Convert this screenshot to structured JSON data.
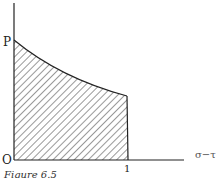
{
  "figure": {
    "caption": "Figure 6.5",
    "labels": {
      "y_intercept": "P",
      "origin": "O",
      "x_tick": "1",
      "x_axis": "σ−τ"
    },
    "colors": {
      "ink": "#333333",
      "background": "#ffffff"
    }
  },
  "diagram": {
    "type": "shaded region under decreasing curve",
    "region": "hatched area bounded by y-axis, x-axis, vertical line at 1, and decreasing curve from P",
    "curve": "decreasing convex curve from P at x=0 to x=1"
  }
}
